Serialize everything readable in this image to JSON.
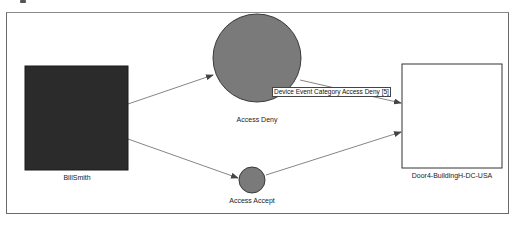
{
  "diagram": {
    "nodes": [
      {
        "id": "billsmith",
        "label": "BillSmith",
        "shape": "square",
        "fill": "#2b2b2b"
      },
      {
        "id": "access_deny",
        "label": "Access Deny",
        "shape": "circle",
        "fill": "#7a7a7a"
      },
      {
        "id": "access_accept",
        "label": "Access Accept",
        "shape": "circle",
        "fill": "#7a7a7a"
      },
      {
        "id": "door4",
        "label": "Door4-BuildingH-DC-USA",
        "shape": "square",
        "fill": "#ffffff"
      }
    ],
    "edges": [
      {
        "from": "billsmith",
        "to": "access_deny"
      },
      {
        "from": "billsmith",
        "to": "access_accept"
      },
      {
        "from": "access_deny",
        "to": "door4"
      },
      {
        "from": "access_accept",
        "to": "door4"
      }
    ],
    "tooltip": "Device Event Category Access Deny [5]"
  }
}
